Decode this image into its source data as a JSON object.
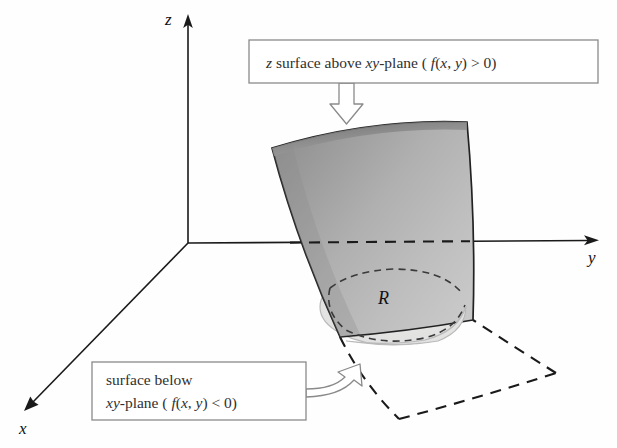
{
  "figure": {
    "title_alt": "Double integral over region R with surface above and below the xy-plane",
    "background_color": "#fefefe"
  },
  "axes": {
    "z_label": "z",
    "y_label": "y",
    "x_label": "x",
    "color": "#1a1a1a",
    "origin": {
      "x": 188,
      "y": 243
    }
  },
  "region": {
    "label": "R",
    "fill_color": "#e3e3e1",
    "hidden_stroke": "#3a3a3a"
  },
  "surface": {
    "fill_light": "#d2d2d2",
    "fill_dark": "#8f8f8f",
    "outline_color": "#222222",
    "below_plane_style": "dashed"
  },
  "callouts": [
    {
      "id": "above-plane",
      "lines": [
        {
          "parts": [
            {
              "text": "z",
              "italic": true
            },
            {
              "text": " surface above ",
              "italic": false
            },
            {
              "text": "xy",
              "italic": true
            },
            {
              "text": "-plane ( ",
              "italic": false
            },
            {
              "text": "f",
              "italic": true
            },
            {
              "text": "(",
              "italic": false
            },
            {
              "text": "x",
              "italic": true
            },
            {
              "text": ", ",
              "italic": false
            },
            {
              "text": "y",
              "italic": true
            },
            {
              "text": ") > 0)",
              "italic": false
            }
          ]
        }
      ],
      "arrow_direction": "down",
      "box": {
        "x": 249,
        "y": 40,
        "width": 349,
        "height": 43
      }
    },
    {
      "id": "below-plane",
      "lines": [
        {
          "parts": [
            {
              "text": "surface below",
              "italic": false
            }
          ]
        },
        {
          "parts": [
            {
              "text": "xy",
              "italic": true
            },
            {
              "text": "-plane ( ",
              "italic": false
            },
            {
              "text": "f",
              "italic": true
            },
            {
              "text": "(",
              "italic": false
            },
            {
              "text": "x",
              "italic": true
            },
            {
              "text": ", ",
              "italic": false
            },
            {
              "text": "y",
              "italic": true
            },
            {
              "text": ") < 0)",
              "italic": false
            }
          ]
        }
      ],
      "arrow_direction": "up-right",
      "box": {
        "x": 92,
        "y": 362,
        "width": 214,
        "height": 58
      }
    }
  ],
  "callout_text": {
    "above_line1": "z surface above xy-plane ( f(x, y) > 0)",
    "below_line1": "surface below",
    "below_line2": "xy-plane ( f(x, y) < 0)"
  }
}
